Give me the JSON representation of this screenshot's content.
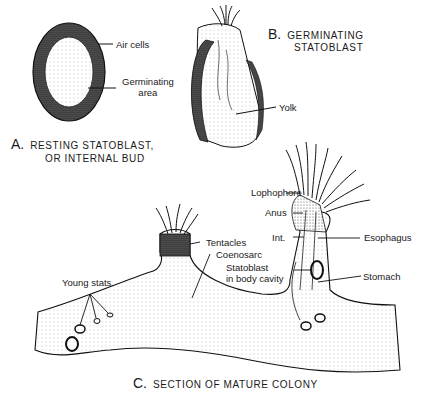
{
  "figure": {
    "panel_a": {
      "letter": "A.",
      "caption_line1": "RESTING STATOBLAST,",
      "caption_line2": "OR INTERNAL BUD",
      "labels": {
        "air_cells": "Air cells",
        "germinating_line1": "Germinating",
        "germinating_line2": "area"
      }
    },
    "panel_b": {
      "letter": "B.",
      "caption_line1": "GERMINATING",
      "caption_line2": "STATOBLAST",
      "labels": {
        "yolk": "Yolk"
      }
    },
    "panel_c": {
      "letter": "C.",
      "caption": "SECTION OF MATURE COLONY",
      "labels": {
        "lophophore": "Lophophore",
        "anus": "Anus",
        "int": "Int.",
        "esophagus": "Esophagus",
        "statoblast_line1": "Statoblast",
        "statoblast_line2": "in body cavity",
        "stomach": "Stomach",
        "tentacles": "Tentacles",
        "coenosarc": "Coenosarc",
        "young_stats": "Young stats."
      }
    }
  }
}
